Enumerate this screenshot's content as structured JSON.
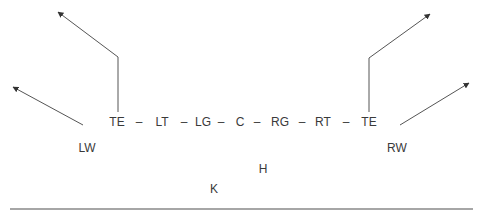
{
  "diagram": {
    "type": "football-formation",
    "line": {
      "players": [
        {
          "id": "te-left",
          "label": "TE",
          "x": 117,
          "y": 122
        },
        {
          "id": "lt",
          "label": "LT",
          "x": 162,
          "y": 122
        },
        {
          "id": "lg",
          "label": "LG",
          "x": 203,
          "y": 122
        },
        {
          "id": "c",
          "label": "C",
          "x": 240,
          "y": 122
        },
        {
          "id": "rg",
          "label": "RG",
          "x": 280,
          "y": 122
        },
        {
          "id": "rt",
          "label": "RT",
          "x": 323,
          "y": 122
        },
        {
          "id": "te-right",
          "label": "TE",
          "x": 369,
          "y": 122
        }
      ],
      "separator": "–",
      "separators_x": [
        139,
        184,
        221,
        257,
        302,
        346
      ]
    },
    "wings": [
      {
        "id": "lw",
        "label": "LW",
        "x": 87,
        "y": 148
      },
      {
        "id": "rw",
        "label": "RW",
        "x": 397,
        "y": 148
      }
    ],
    "backs": [
      {
        "id": "h",
        "label": "H",
        "x": 263,
        "y": 169
      },
      {
        "id": "k",
        "label": "K",
        "x": 214,
        "y": 189
      }
    ],
    "routes": [
      {
        "id": "route-te-left",
        "points": [
          [
            118,
            112
          ],
          [
            118,
            57
          ],
          [
            58,
            12
          ]
        ]
      },
      {
        "id": "route-lw",
        "points": [
          [
            83,
            125
          ],
          [
            13,
            87
          ]
        ]
      },
      {
        "id": "route-te-right",
        "points": [
          [
            369,
            112
          ],
          [
            369,
            58
          ],
          [
            430,
            14
          ]
        ]
      },
      {
        "id": "route-rw",
        "points": [
          [
            400,
            125
          ],
          [
            469,
            83
          ]
        ]
      }
    ],
    "baseline": {
      "x1": 10,
      "x2": 473,
      "y": 209
    },
    "colors": {
      "route": "#555555",
      "text": "#3a3a3a",
      "baseline": "#888888"
    }
  }
}
